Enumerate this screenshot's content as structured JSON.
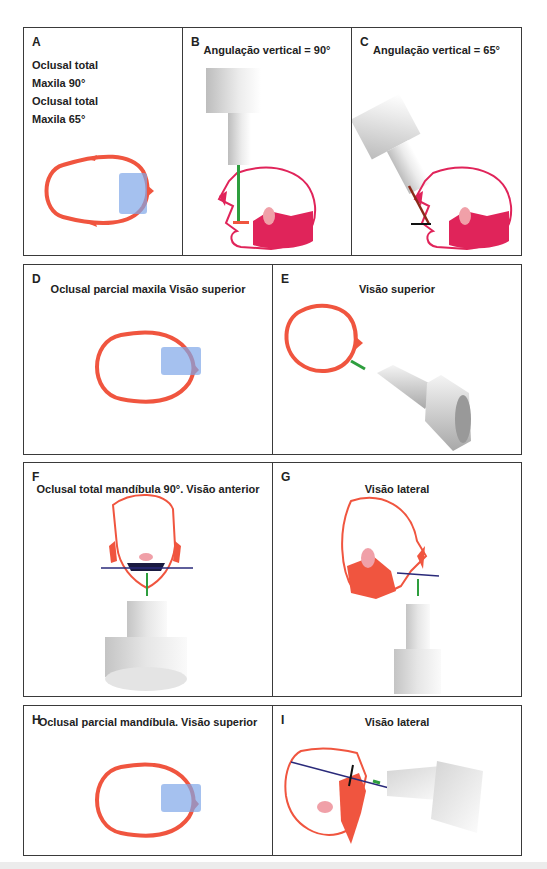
{
  "colors": {
    "skull_outline": "#f0553f",
    "lateral_skull": "#e0245a",
    "film_overlay": "#7fa6e8",
    "central_ray_green": "#2e9e3e",
    "central_ray_brown": "#8b2a1a",
    "occlusal_line": "#2a2a7a",
    "border": "#3a3a3a"
  },
  "panels": {
    "A": {
      "letter": "A",
      "lines": [
        "Oclusal total",
        "Maxila 90°",
        "Oclusal total",
        "Maxila 65°"
      ],
      "view": "top-view skull with film"
    },
    "B": {
      "letter": "B",
      "title": "Angulação vertical = 90°"
    },
    "C": {
      "letter": "C",
      "title": "Angulação vertical = 65°"
    },
    "D": {
      "letter": "D",
      "title": "Oclusal parcial maxila Visão superior"
    },
    "E": {
      "letter": "E",
      "title": "Visão superior"
    },
    "F": {
      "letter": "F",
      "title": "Oclusal total mandíbula 90°. Visão anterior"
    },
    "G": {
      "letter": "G",
      "title": "Visão lateral"
    },
    "H": {
      "letter": "H",
      "title": "Oclusal parcial mandíbula. Visão superior"
    },
    "I": {
      "letter": "I",
      "title": "Visão lateral"
    }
  }
}
